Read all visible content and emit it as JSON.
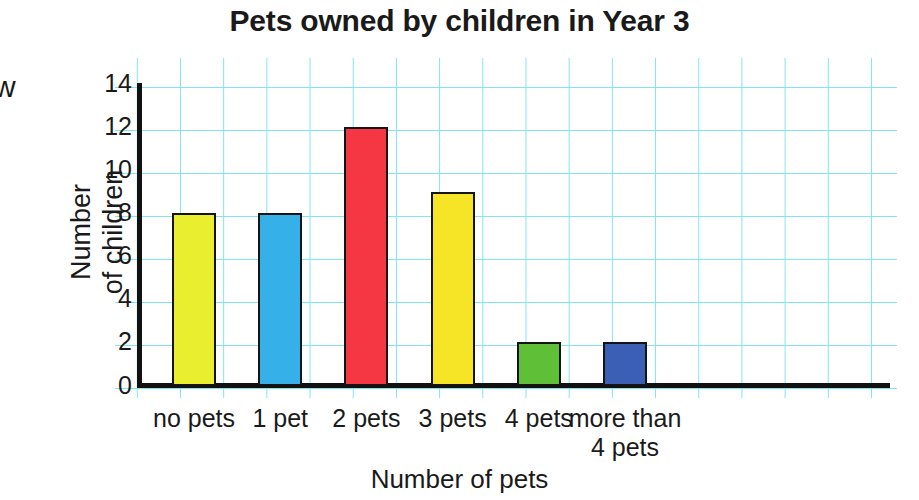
{
  "chart_data": {
    "type": "bar",
    "title": "Pets owned by children in Year 3",
    "xlabel": "Number of pets",
    "ylabel": "Number\nof children",
    "categories": [
      "no pets",
      "1 pet",
      "2 pets",
      "3 pets",
      "4 pets",
      "more than\n4 pets"
    ],
    "values": [
      8,
      8,
      12,
      9,
      2,
      2
    ],
    "bar_colors": [
      "#e9ef2f",
      "#35b0e8",
      "#f53744",
      "#f6e526",
      "#5fbf37",
      "#3b5fb5"
    ],
    "ylim": [
      0,
      14
    ],
    "ytick_labels": [
      "0",
      "2",
      "4",
      "6",
      "8",
      "10",
      "12",
      "14"
    ],
    "ytick_values": [
      0,
      2,
      4,
      6,
      8,
      10,
      12,
      14
    ],
    "grid": "cyan square graph paper",
    "grid_color": "#7fe6f2",
    "axis_color": "#111111",
    "legend": "none"
  },
  "edge_fragment": "w"
}
